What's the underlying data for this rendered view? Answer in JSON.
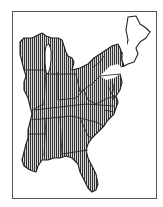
{
  "map": {
    "type": "range-map",
    "region": "Eastern United States",
    "frame": {
      "x": 12,
      "y": 11,
      "width": 144,
      "height": 187
    },
    "colors": {
      "background": "#ffffff",
      "frame": "#555555",
      "outline": "#222222",
      "hatch": "#333333",
      "hatch_gap": "#d8d8d8",
      "unhatched_fill": "#ffffff"
    },
    "hatch": {
      "orientation": "vertical",
      "pitch_px": 2,
      "line_px": 1
    },
    "legend": null,
    "title": null,
    "hatched_area": "Most of the eastern US from Wisconsin/Illinois to the Atlantic and Gulf coasts",
    "unhatched_area": "Northern New England (Maine, New Hampshire, Vermont east half, Massachusetts, Connecticut, Rhode Island) and a strip of southeast Pennsylvania / New Jersey"
  }
}
